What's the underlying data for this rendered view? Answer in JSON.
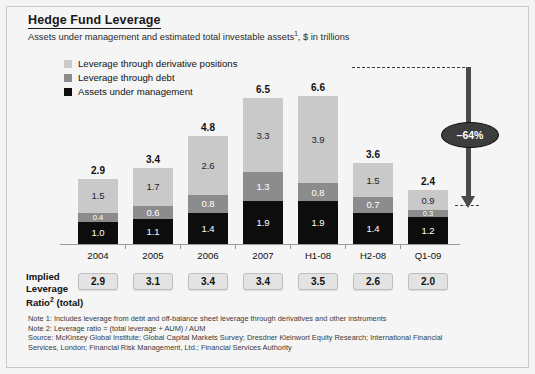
{
  "header": {
    "title": "Hedge Fund Leverage",
    "subtitle_pre": "Assets under management and estimated total investable assets",
    "subtitle_sup": "1",
    "subtitle_post": ", $ in trillions"
  },
  "legend": {
    "items": [
      {
        "label": "Leverage through derivative positions",
        "color": "#c9c9c9",
        "key": "derivative"
      },
      {
        "label": "Leverage through debt",
        "color": "#8c8c8c",
        "key": "debt"
      },
      {
        "label": "Assets under management",
        "color": "#0d0d0d",
        "key": "aum"
      }
    ]
  },
  "callout": {
    "value": "–64%",
    "name": "decline-callout"
  },
  "ratio_row": {
    "label_line1": "Implied",
    "label_line2": "Leverage",
    "label_line3_pre": "Ratio",
    "label_line3_sup": "2",
    "label_line3_post": " (total)",
    "values": [
      "2.9",
      "3.1",
      "3.4",
      "3.4",
      "3.5",
      "2.6",
      "2.0"
    ]
  },
  "notes": {
    "note1": "Note 1: Includes leverage from debt and off-balance sheet leverage through derivatives and other instruments",
    "note2": "Note 2: Leverage ratio = (total leverage + AUM) / AUM",
    "source_line1": "Source: McKinsey Global Institute; Global Capital Markets Survey; Dresdner Kleinwort Equity Research; International Financial",
    "source_line2": "Services, London; Financial Risk Management, Ltd.; Financial Services Authority"
  },
  "chart_data": {
    "type": "bar",
    "stacked": true,
    "title": "Hedge Fund Leverage",
    "subtitle": "Assets under management and estimated total investable assets1, $ in trillions",
    "xlabel": "",
    "ylabel": "$ in trillions",
    "ylim": [
      0,
      6.6
    ],
    "grid": false,
    "legend_position": "top-left",
    "categories": [
      "2004",
      "2005",
      "2006",
      "2007",
      "H1-08",
      "H2-08",
      "Q1-09"
    ],
    "totals": [
      "2.9",
      "3.4",
      "4.8",
      "6.5",
      "6.6",
      "3.6",
      "2.4"
    ],
    "series": [
      {
        "name": "Leverage through derivative positions",
        "color": "#c9c9c9",
        "values": [
          1.5,
          1.7,
          2.6,
          3.3,
          3.9,
          1.5,
          0.9
        ],
        "labels": [
          "1.5",
          "1.7",
          "2.6",
          "3.3",
          "3.9",
          "1.5",
          "0.9"
        ]
      },
      {
        "name": "Leverage through debt",
        "color": "#8c8c8c",
        "values": [
          0.4,
          0.6,
          0.8,
          1.3,
          0.8,
          0.7,
          0.3
        ],
        "labels": [
          "0.4",
          "0.6",
          "0.8",
          "1.3",
          "0.8",
          "0.7",
          "0.3"
        ]
      },
      {
        "name": "Assets under management",
        "color": "#0d0d0d",
        "values": [
          1.0,
          1.1,
          1.4,
          1.9,
          1.9,
          1.4,
          1.2
        ],
        "labels": [
          "1.0",
          "1.1",
          "1.4",
          "1.9",
          "1.9",
          "1.4",
          "1.2"
        ]
      }
    ],
    "annotations": [
      {
        "text": "–64%",
        "type": "arrow-callout",
        "from_category": "H1-08",
        "to_category": "Q1-09"
      }
    ]
  }
}
